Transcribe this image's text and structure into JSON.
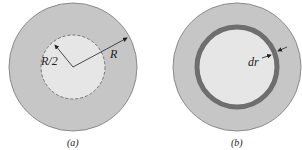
{
  "figure_a": {
    "caption": "(a)",
    "outer_radius_label": "R",
    "inner_radius_label": "R/2"
  },
  "figure_b": {
    "caption": "(b)",
    "shell_thickness_label": "dr"
  },
  "colors": {
    "outer_fill": "#c6c6c6",
    "inner_fill": "#e8e8e8",
    "shell_ring": "#6e6e6e",
    "outline": "#8a8a8a"
  }
}
